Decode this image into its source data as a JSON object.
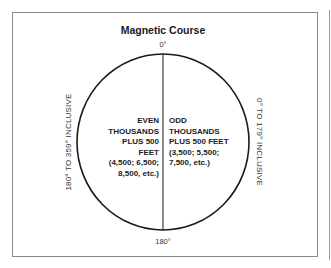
{
  "title": "Magnetic Course",
  "labels": {
    "top_degree": "0°",
    "bottom_degree": "180°",
    "left_side": "180° TO 359° INCLUSIVE",
    "right_side": "0° TO 179° INCLUSIVE"
  },
  "left_half": {
    "lines": [
      "EVEN",
      "THOUSANDS",
      "PLUS 500",
      "FEET",
      "(4,500; 6,500;",
      "8,500, etc.)"
    ]
  },
  "right_half": {
    "lines": [
      "ODD",
      "THOUSANDS",
      "PLUS 500 FEET",
      "(3,500; 5,500;",
      "7,500, etc.)"
    ]
  },
  "colors": {
    "stroke": "#1a1a1a",
    "frame": "#8a8a8a",
    "background": "#ffffff"
  }
}
